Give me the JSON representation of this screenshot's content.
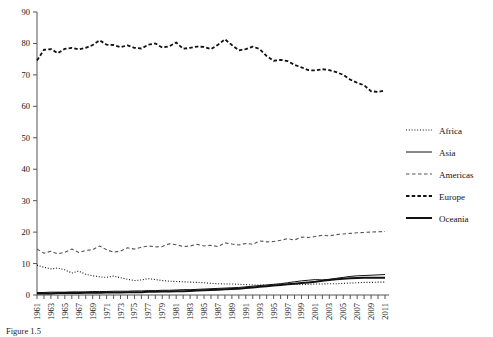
{
  "chart_data": {
    "type": "line",
    "title": "",
    "xlabel": "",
    "ylabel": "",
    "ylim": [
      0,
      90
    ],
    "ytick_step": 10,
    "yticks": [
      0,
      10,
      20,
      30,
      40,
      50,
      60,
      70,
      80,
      90
    ],
    "grid": false,
    "legend_position": "right",
    "x": [
      1961,
      1962,
      1963,
      1964,
      1965,
      1966,
      1967,
      1968,
      1969,
      1970,
      1971,
      1972,
      1973,
      1974,
      1975,
      1976,
      1977,
      1978,
      1979,
      1980,
      1981,
      1982,
      1983,
      1984,
      1985,
      1986,
      1987,
      1988,
      1989,
      1990,
      1991,
      1992,
      1993,
      1994,
      1995,
      1996,
      1997,
      1998,
      1999,
      2000,
      2001,
      2002,
      2003,
      2004,
      2005,
      2006,
      2007,
      2008,
      2009,
      2010,
      2011
    ],
    "xtick_labels": [
      "1961",
      "1963",
      "1965",
      "1967",
      "1969",
      "1971",
      "1973",
      "1975",
      "1977",
      "1979",
      "1981",
      "1983",
      "1985",
      "1987",
      "1989",
      "1991",
      "1993",
      "1995",
      "1997",
      "1999",
      "2001",
      "2003",
      "2005",
      "2007",
      "2009",
      "2011"
    ],
    "series": [
      {
        "name": "Africa",
        "style": "dotted",
        "color": "#111111",
        "width": 1.1,
        "values": [
          9.5,
          8.8,
          8.3,
          8.6,
          8.0,
          7.0,
          7.6,
          6.6,
          6.1,
          5.8,
          5.6,
          6.0,
          5.5,
          5.0,
          4.6,
          4.8,
          5.2,
          4.9,
          4.6,
          4.4,
          4.3,
          4.2,
          4.1,
          4.0,
          3.9,
          3.7,
          3.6,
          3.5,
          3.5,
          3.4,
          3.3,
          3.2,
          3.2,
          3.1,
          3.2,
          3.3,
          3.4,
          3.4,
          3.3,
          3.4,
          3.5,
          3.5,
          3.6,
          3.6,
          3.7,
          3.8,
          3.9,
          4.0,
          4.0,
          4.1,
          4.1
        ]
      },
      {
        "name": "Asia",
        "style": "solid-thin",
        "color": "#111111",
        "width": 1.0,
        "values": [
          0.8,
          0.8,
          0.9,
          0.9,
          0.9,
          1.0,
          1.0,
          1.0,
          1.1,
          1.1,
          1.1,
          1.2,
          1.2,
          1.2,
          1.3,
          1.3,
          1.4,
          1.4,
          1.5,
          1.5,
          1.6,
          1.7,
          1.7,
          1.8,
          1.9,
          2.0,
          2.1,
          2.2,
          2.3,
          2.4,
          2.6,
          2.8,
          3.0,
          3.2,
          3.4,
          3.6,
          3.9,
          4.2,
          4.5,
          4.7,
          4.9,
          4.8,
          5.0,
          5.3,
          5.6,
          5.9,
          6.1,
          6.2,
          6.3,
          6.4,
          6.5
        ]
      },
      {
        "name": "Americas",
        "style": "dashed-thin",
        "color": "#555555",
        "width": 1.1,
        "values": [
          14.6,
          13.3,
          13.9,
          13.1,
          13.6,
          14.6,
          13.5,
          14.2,
          14.4,
          15.6,
          14.4,
          13.6,
          14.0,
          15.0,
          14.6,
          15.2,
          15.6,
          15.3,
          15.4,
          16.3,
          16.0,
          15.4,
          15.6,
          16.1,
          15.6,
          15.8,
          15.4,
          16.6,
          16.2,
          15.9,
          16.4,
          16.1,
          17.2,
          16.9,
          17.0,
          17.4,
          17.9,
          17.5,
          18.4,
          18.3,
          18.6,
          19.0,
          18.8,
          19.2,
          19.4,
          19.6,
          19.8,
          19.9,
          20.0,
          20.1,
          20.2
        ]
      },
      {
        "name": "Europe",
        "style": "dashed-bold",
        "color": "#111111",
        "width": 1.8,
        "values": [
          74.6,
          78.0,
          78.2,
          76.9,
          78.3,
          78.6,
          78.1,
          78.6,
          79.5,
          81.0,
          79.6,
          79.5,
          78.8,
          79.4,
          78.6,
          78.4,
          79.6,
          80.0,
          78.7,
          79.1,
          80.3,
          78.3,
          78.6,
          79.0,
          78.9,
          78.2,
          79.6,
          81.3,
          79.5,
          77.8,
          78.2,
          79.0,
          78.2,
          76.0,
          74.5,
          74.8,
          74.4,
          73.2,
          72.4,
          71.5,
          71.4,
          71.8,
          71.5,
          70.9,
          70.0,
          68.5,
          67.5,
          66.7,
          64.8,
          64.6,
          65.0
        ]
      },
      {
        "name": "Oceania",
        "style": "solid-thick",
        "color": "#111111",
        "width": 2.0,
        "values": [
          0.5,
          0.5,
          0.5,
          0.6,
          0.6,
          0.6,
          0.6,
          0.7,
          0.7,
          0.7,
          0.8,
          0.8,
          0.8,
          0.9,
          0.9,
          0.9,
          1.0,
          1.0,
          1.1,
          1.1,
          1.2,
          1.2,
          1.3,
          1.4,
          1.5,
          1.6,
          1.7,
          1.8,
          1.9,
          2.0,
          2.2,
          2.4,
          2.6,
          2.8,
          3.0,
          3.2,
          3.4,
          3.6,
          3.8,
          4.0,
          4.2,
          4.5,
          4.8,
          5.0,
          5.2,
          5.3,
          5.4,
          5.5,
          5.5,
          5.5,
          5.5
        ]
      }
    ]
  },
  "legend": {
    "items": [
      {
        "label": "Africa"
      },
      {
        "label": "Asia"
      },
      {
        "label": "Americas"
      },
      {
        "label": "Europe"
      },
      {
        "label": "Oceania"
      }
    ]
  },
  "caption": {
    "text": "Figure 1.5"
  }
}
